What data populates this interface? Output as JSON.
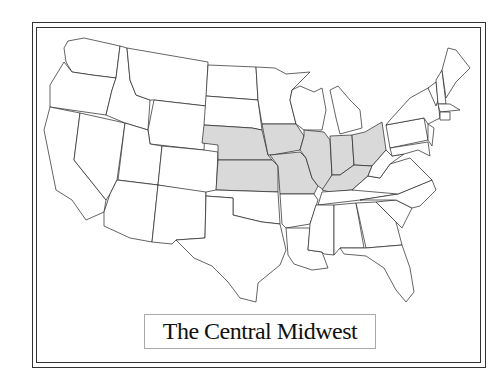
{
  "map": {
    "title": "The Central Midwest",
    "highlight_color": "#d9d9d9",
    "border_color": "#222222",
    "highlighted_states": [
      "Nebraska",
      "Kansas",
      "Iowa",
      "Missouri",
      "Illinois",
      "Indiana",
      "Ohio",
      "Kentucky"
    ],
    "states": [
      {
        "name": "Washington",
        "highlight": false,
        "points": "68,41 84,38 120,46 116,78 92,75 72,72 66,62 64,48"
      },
      {
        "name": "Oregon",
        "highlight": false,
        "points": "64,62 72,72 92,75 116,78 112,90 106,115 50,107 50,85"
      },
      {
        "name": "California",
        "highlight": false,
        "points": "50,107 80,113 74,160 106,200 104,212 86,220 72,200 56,190 50,160 44,130"
      },
      {
        "name": "Nevada",
        "highlight": false,
        "points": "80,113 125,123 117,180 110,194 106,200 74,160"
      },
      {
        "name": "Idaho",
        "highlight": false,
        "points": "120,46 127,48 130,80 136,95 150,100 148,130 125,123 106,115 112,90 116,78"
      },
      {
        "name": "Montana",
        "highlight": false,
        "points": "127,48 208,62 206,106 154,100 150,100 136,95 130,80"
      },
      {
        "name": "Wyoming",
        "highlight": false,
        "points": "154,100 206,106 204,150 150,144 148,130"
      },
      {
        "name": "Utah",
        "highlight": false,
        "points": "125,123 148,130 150,144 162,146 158,185 118,180"
      },
      {
        "name": "Colorado",
        "highlight": false,
        "points": "162,146 204,150 218,152 216,196 158,185"
      },
      {
        "name": "Arizona",
        "highlight": false,
        "points": "117,180 158,185 152,242 130,238 104,226 104,212 110,194"
      },
      {
        "name": "New Mexico",
        "highlight": false,
        "points": "158,185 206,192 205,238 176,240 172,244 152,242"
      },
      {
        "name": "North Dakota",
        "highlight": false,
        "points": "208,65 256,67 258,100 206,96"
      },
      {
        "name": "South Dakota",
        "highlight": false,
        "points": "206,96 258,100 262,130 252,128 204,125"
      },
      {
        "name": "Nebraska",
        "highlight": true,
        "points": "204,125 252,128 262,130 268,155 272,160 218,160 218,145 202,143"
      },
      {
        "name": "Kansas",
        "highlight": true,
        "points": "218,160 272,160 278,166 278,192 216,190"
      },
      {
        "name": "Oklahoma",
        "highlight": false,
        "points": "206,192 216,190 278,192 280,224 262,222 245,218 233,215 233,198 206,196"
      },
      {
        "name": "Texas",
        "highlight": false,
        "points": "206,196 233,198 233,215 245,218 262,222 280,224 286,250 280,265 258,283 256,302 240,298 228,282 212,266 194,258 176,240 205,238"
      },
      {
        "name": "Minnesota",
        "highlight": false,
        "points": "256,67 275,68 286,74 310,72 292,90 290,100 296,124 262,124 258,100"
      },
      {
        "name": "Iowa",
        "highlight": true,
        "points": "262,124 296,124 304,136 300,150 272,155 268,155"
      },
      {
        "name": "Missouri",
        "highlight": true,
        "points": "270,155 300,152 306,158 312,178 318,186 314,194 280,194 278,166"
      },
      {
        "name": "Arkansas",
        "highlight": false,
        "points": "280,194 314,194 318,200 310,224 286,228 282,224"
      },
      {
        "name": "Louisiana",
        "highlight": false,
        "points": "286,228 310,228 308,250 322,252 328,268 312,270 294,264 288,255"
      },
      {
        "name": "Wisconsin",
        "highlight": false,
        "points": "292,90 300,86 314,92 322,88 326,110 322,130 304,130 296,124 290,100"
      },
      {
        "name": "Illinois",
        "highlight": true,
        "points": "304,130 324,132 330,140 332,175 324,190 318,186 312,178 306,158 300,150 304,136"
      },
      {
        "name": "Michigan",
        "highlight": false,
        "points": "330,90 338,86 350,100 360,110 362,128 340,134 336,118"
      },
      {
        "name": "Indiana",
        "highlight": true,
        "points": "330,136 352,135 354,165 340,175 332,175"
      },
      {
        "name": "Ohio",
        "highlight": true,
        "points": "352,135 365,132 382,122 386,150 372,166 354,165"
      },
      {
        "name": "Kentucky",
        "highlight": true,
        "points": "322,190 332,175 340,175 354,165 372,166 368,176 352,190 330,192"
      },
      {
        "name": "Tennessee",
        "highlight": false,
        "points": "322,192 352,190 408,178 398,194 360,200 318,205"
      },
      {
        "name": "Mississippi",
        "highlight": false,
        "points": "316,205 334,205 334,255 324,254 322,252 308,250 310,224"
      },
      {
        "name": "Alabama",
        "highlight": false,
        "points": "334,205 356,203 364,248 340,248 334,255"
      },
      {
        "name": "Georgia",
        "highlight": false,
        "points": "356,203 376,202 396,222 402,245 366,248"
      },
      {
        "name": "Florida",
        "highlight": false,
        "points": "340,248 366,248 402,245 410,268 414,292 406,302 396,290 384,268 366,256 344,254"
      },
      {
        "name": "South Carolina",
        "highlight": false,
        "points": "376,202 396,200 412,208 402,228 396,222"
      },
      {
        "name": "North Carolina",
        "highlight": false,
        "points": "360,200 398,194 432,180 436,190 420,206 412,208 396,200"
      },
      {
        "name": "Virginia",
        "highlight": false,
        "points": "368,176 380,178 390,164 410,158 420,168 432,180 398,194 352,190"
      },
      {
        "name": "West Virginia",
        "highlight": false,
        "points": "372,166 386,150 392,156 404,154 390,164 380,178 368,176"
      },
      {
        "name": "Pennsylvania",
        "highlight": false,
        "points": "386,125 424,118 428,140 390,148"
      },
      {
        "name": "New York",
        "highlight": false,
        "points": "390,120 410,98 428,88 436,86 440,118 428,124 424,118 386,125"
      },
      {
        "name": "Maryland",
        "highlight": false,
        "points": "390,148 428,142 430,156 418,150 404,154 392,156"
      },
      {
        "name": "New Jersey",
        "highlight": false,
        "points": "428,124 434,128 432,146 428,140"
      },
      {
        "name": "Vermont",
        "highlight": false,
        "points": "428,88 436,82 438,100 436,106"
      },
      {
        "name": "New Hampshire",
        "highlight": false,
        "points": "436,80 442,70 446,104 438,104"
      },
      {
        "name": "Maine",
        "highlight": false,
        "points": "442,70 448,48 456,50 470,68 456,82 446,98"
      },
      {
        "name": "Massachusetts",
        "highlight": false,
        "points": "438,104 450,104 460,110 440,112"
      },
      {
        "name": "Connecticut",
        "highlight": false,
        "points": "440,112 450,112 450,120 440,120"
      }
    ]
  }
}
